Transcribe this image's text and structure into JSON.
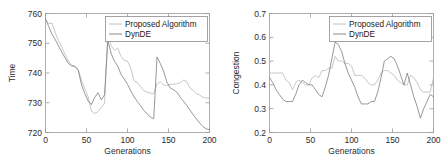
{
  "figure": {
    "panel_count": 2,
    "background": "#ffffff"
  },
  "chart_data": [
    {
      "type": "line",
      "title": "",
      "xlabel": "Generations",
      "ylabel": "Time",
      "xlim": [
        0,
        200
      ],
      "ylim": [
        720,
        760
      ],
      "xticks": [
        0,
        50,
        100,
        150,
        200
      ],
      "yticks": [
        720,
        730,
        740,
        750,
        760
      ],
      "xticklabels": [
        "0",
        "50",
        "100",
        "150",
        "200"
      ],
      "yticklabels": [
        "720",
        "730",
        "740",
        "750",
        "760"
      ],
      "grid": false,
      "legend_position": "upper right",
      "legend": [
        "Proposed Algorithm",
        "DynDE"
      ],
      "colors": [
        "#b9b9b9",
        "#7d7d7d"
      ],
      "x": [
        0,
        4,
        8,
        12,
        16,
        20,
        24,
        28,
        32,
        36,
        40,
        44,
        48,
        52,
        56,
        60,
        64,
        68,
        72,
        76,
        80,
        84,
        88,
        92,
        96,
        100,
        104,
        108,
        112,
        116,
        120,
        124,
        128,
        132,
        136,
        140,
        144,
        148,
        152,
        156,
        160,
        164,
        168,
        172,
        176,
        180,
        184,
        188,
        192,
        196,
        200
      ],
      "series": [
        {
          "name": "Proposed Algorithm",
          "values": [
            758.0,
            756.6,
            756.8,
            753.5,
            750.8,
            748.6,
            746.2,
            744.0,
            742.6,
            742.3,
            741.2,
            737.4,
            734.8,
            732.0,
            727.2,
            726.4,
            727.0,
            728.4,
            729.8,
            753.6,
            749.2,
            747.6,
            748.4,
            745.6,
            744.2,
            744.0,
            741.6,
            737.4,
            736.8,
            735.4,
            734.0,
            733.6,
            733.2,
            733.0,
            736.4,
            737.0,
            736.0,
            735.8,
            736.2,
            736.2,
            736.4,
            736.6,
            737.6,
            737.2,
            735.0,
            734.2,
            733.0,
            732.6,
            731.8,
            731.6,
            731.6
          ]
        },
        {
          "name": "DynDE",
          "values": [
            758.2,
            755.6,
            753.0,
            751.2,
            749.0,
            747.0,
            745.0,
            743.2,
            742.4,
            742.2,
            740.8,
            736.0,
            733.0,
            730.6,
            729.4,
            731.8,
            733.4,
            731.0,
            732.6,
            751.0,
            746.6,
            744.0,
            742.4,
            739.6,
            738.0,
            736.2,
            734.0,
            732.0,
            730.4,
            729.0,
            727.4,
            726.2,
            725.2,
            724.6,
            745.4,
            743.2,
            740.6,
            737.0,
            735.0,
            734.4,
            733.6,
            732.0,
            730.6,
            729.2,
            727.6,
            726.0,
            724.6,
            723.2,
            722.0,
            721.2,
            721.0
          ]
        }
      ]
    },
    {
      "type": "line",
      "title": "",
      "xlabel": "Generations",
      "ylabel": "Congestion",
      "xlim": [
        0,
        200
      ],
      "ylim": [
        0.2,
        0.7
      ],
      "xticks": [
        0,
        50,
        100,
        150,
        200
      ],
      "yticks": [
        0.2,
        0.3,
        0.4,
        0.5,
        0.6,
        0.7
      ],
      "xticklabels": [
        "0",
        "50",
        "100",
        "150",
        "200"
      ],
      "yticklabels": [
        "0.2",
        "0.3",
        "0.4",
        "0.5",
        "0.6",
        "0.7"
      ],
      "grid": false,
      "legend_position": "upper right",
      "legend": [
        "Proposed Algorithm",
        "DynDE"
      ],
      "colors": [
        "#b9b9b9",
        "#7d7d7d"
      ],
      "x": [
        0,
        4,
        8,
        12,
        16,
        20,
        24,
        28,
        32,
        36,
        40,
        44,
        48,
        52,
        56,
        60,
        64,
        68,
        72,
        76,
        80,
        84,
        88,
        92,
        96,
        100,
        104,
        108,
        112,
        116,
        120,
        124,
        128,
        132,
        136,
        140,
        144,
        148,
        152,
        156,
        160,
        164,
        168,
        172,
        176,
        180,
        184,
        188,
        192,
        196,
        200
      ],
      "series": [
        {
          "name": "Proposed Algorithm",
          "values": [
            0.45,
            0.45,
            0.45,
            0.45,
            0.45,
            0.42,
            0.41,
            0.38,
            0.41,
            0.42,
            0.41,
            0.4,
            0.4,
            0.43,
            0.44,
            0.43,
            0.46,
            0.46,
            0.47,
            0.47,
            0.52,
            0.5,
            0.5,
            0.49,
            0.49,
            0.48,
            0.44,
            0.44,
            0.44,
            0.43,
            0.41,
            0.4,
            0.4,
            0.42,
            0.45,
            0.46,
            0.46,
            0.45,
            0.44,
            0.42,
            0.41,
            0.4,
            0.4,
            0.44,
            0.43,
            0.41,
            0.38,
            0.37,
            0.37,
            0.37,
            0.43
          ]
        },
        {
          "name": "DynDE",
          "values": [
            0.43,
            0.41,
            0.38,
            0.36,
            0.34,
            0.33,
            0.33,
            0.33,
            0.36,
            0.4,
            0.42,
            0.41,
            0.4,
            0.4,
            0.38,
            0.36,
            0.35,
            0.39,
            0.44,
            0.51,
            0.58,
            0.57,
            0.54,
            0.49,
            0.45,
            0.42,
            0.39,
            0.35,
            0.32,
            0.32,
            0.32,
            0.33,
            0.33,
            0.37,
            0.43,
            0.5,
            0.51,
            0.52,
            0.51,
            0.48,
            0.44,
            0.4,
            0.45,
            0.4,
            0.35,
            0.31,
            0.26,
            0.3,
            0.33,
            0.36,
            0.35
          ]
        }
      ]
    }
  ]
}
